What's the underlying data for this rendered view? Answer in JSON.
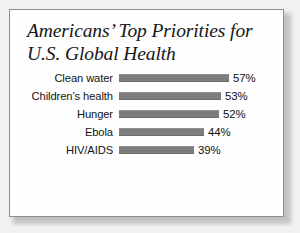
{
  "chart_data": {
    "type": "bar",
    "orientation": "horizontal",
    "title_lines": [
      "Americans’ Top Priorities for",
      "U.S. Global Health"
    ],
    "categories": [
      "Clean water",
      "Children’s health",
      "Hunger",
      "Ebola",
      "HIV/AIDS"
    ],
    "values": [
      57,
      53,
      52,
      44,
      39
    ],
    "value_labels": [
      "57%",
      "53%",
      "52%",
      "44%",
      "39%"
    ],
    "value_suffix": "%",
    "xlabel": "",
    "ylabel": "",
    "xlim": [
      0,
      57
    ],
    "grid": false,
    "legend": null,
    "series": [
      {
        "name": "Share of Americans",
        "values": [
          57,
          53,
          52,
          44,
          39
        ]
      }
    ],
    "bars": [
      {
        "label": "Clean water",
        "value": 57,
        "value_label": "57%",
        "bar_px": 110
      },
      {
        "label": "Children’s health",
        "value": 53,
        "value_label": "53%",
        "bar_px": 102
      },
      {
        "label": "Hunger",
        "value": 52,
        "value_label": "52%",
        "bar_px": 100
      },
      {
        "label": "Ebola",
        "value": 44,
        "value_label": "44%",
        "bar_px": 85
      },
      {
        "label": "HIV/AIDS",
        "value": 39,
        "value_label": "39%",
        "bar_px": 75
      }
    ]
  },
  "colors": {
    "bar": "#7d7d7d",
    "card_background": "#fefefe",
    "card_border": "#8d8d8b",
    "page_background": "#f2f2f1",
    "text": "#131313"
  }
}
